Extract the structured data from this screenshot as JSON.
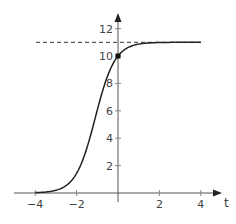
{
  "chart_data": {
    "type": "line",
    "title": "",
    "xlabel": "t",
    "ylabel": "",
    "xlim": [
      -5.7,
      4.8
    ],
    "ylim": [
      0,
      13
    ],
    "grid": false,
    "legend": null,
    "x_ticks": [
      -4,
      -2,
      2,
      4
    ],
    "x_tick_labels": [
      "−4",
      "−2",
      "2",
      "4"
    ],
    "y_ticks": [
      2,
      4,
      6,
      8,
      10,
      12
    ],
    "y_tick_labels": [
      "2",
      "4",
      "6",
      "8",
      "10",
      "12"
    ],
    "series": [
      {
        "name": "logistic curve",
        "function": "11 / (1 + 0.1 * exp(-2.1 t))",
        "x": [
          -4,
          -3.5,
          -3,
          -2.5,
          -2,
          -1.5,
          -1,
          -0.5,
          0,
          0.5,
          1,
          1.5,
          2,
          3,
          4
        ],
        "values": [
          0.025,
          0.07,
          0.2,
          0.55,
          1.43,
          3.32,
          6.02,
          8.41,
          10.0,
          10.66,
          10.89,
          10.96,
          10.98,
          11.0,
          11.0
        ]
      }
    ],
    "annotations": [
      {
        "type": "dashed_horizontal_line",
        "y": 11,
        "label": "asymptote"
      },
      {
        "type": "point",
        "x": 0,
        "y": 10,
        "marker": "filled square"
      }
    ]
  }
}
